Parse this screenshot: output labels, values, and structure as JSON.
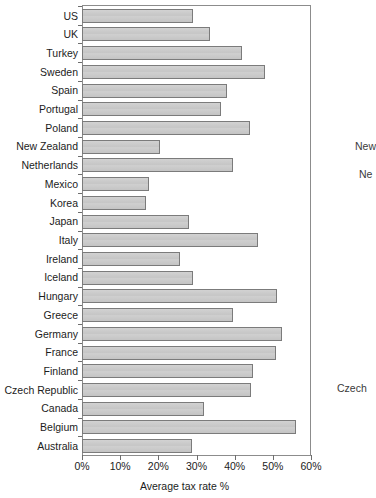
{
  "chart_data": {
    "type": "bar",
    "orientation": "horizontal",
    "title": "",
    "xlabel": "Average tax rate %",
    "ylabel": "",
    "xlim": [
      0,
      60
    ],
    "ylim": null,
    "grid": false,
    "legend": null,
    "xtick_labels": [
      "0%",
      "10%",
      "20%",
      "30%",
      "40%",
      "50%",
      "60%"
    ],
    "xtick_values": [
      0,
      10,
      20,
      30,
      40,
      50,
      60
    ],
    "categories": [
      "US",
      "UK",
      "Turkey",
      "Sweden",
      "Spain",
      "Portugal",
      "Poland",
      "New Zealand",
      "Netherlands",
      "Mexico",
      "Korea",
      "Japan",
      "Italy",
      "Ireland",
      "Iceland",
      "Hungary",
      "Greece",
      "Germany",
      "France",
      "Finland",
      "Czech Republic",
      "Canada",
      "Belgium",
      "Australia"
    ],
    "values": [
      29.0,
      33.5,
      42.0,
      48.0,
      38.0,
      36.5,
      44.0,
      20.5,
      39.5,
      17.5,
      16.8,
      28.0,
      46.0,
      25.8,
      29.2,
      51.0,
      39.5,
      52.5,
      50.8,
      44.8,
      44.2,
      32.0,
      56.0,
      28.8
    ],
    "bar_fill_color": "#c9c9c9",
    "bar_edge_color": "#7b7b7b",
    "axis_color": "#8c8c8c"
  },
  "artifacts": {
    "ghost_text_1": "New",
    "ghost_text_2": "Ne",
    "ghost_text_3": "Czech"
  }
}
